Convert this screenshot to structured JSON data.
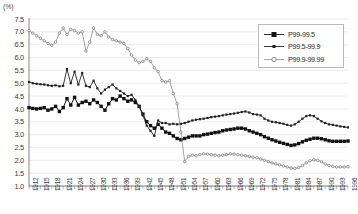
{
  "chart_data": {
    "type": "line",
    "title": "",
    "subtitle": "",
    "unit_label": "(%)",
    "xlabel": "",
    "ylabel": "",
    "ylim": [
      1.0,
      7.5
    ],
    "ytick_step": 0.5,
    "yticks": [
      "7.5",
      "7.0",
      "6.5",
      "6.0",
      "5.5",
      "5.0",
      "4.5",
      "4.0",
      "3.5",
      "3.0",
      "2.5",
      "2.0",
      "1.5",
      "1.0"
    ],
    "xlim": [
      1912,
      1996
    ],
    "xtick_interval_years": 1,
    "xtick_label_interval_years": 3,
    "xticklabels": [
      "1912",
      "1915",
      "1918",
      "1921",
      "1924",
      "1927",
      "1930",
      "1933",
      "1936",
      "1939",
      "1942",
      "1945",
      "1948",
      "1951",
      "1954",
      "1957",
      "1960",
      "1963",
      "1966",
      "1969",
      "1972",
      "1975",
      "1978",
      "1981",
      "1984",
      "1987",
      "1990",
      "1993",
      "1996"
    ],
    "grid": true,
    "grid_axis": "y",
    "legend_position": "top-right",
    "x": [
      1912,
      1913,
      1914,
      1915,
      1916,
      1917,
      1918,
      1919,
      1920,
      1921,
      1922,
      1923,
      1924,
      1925,
      1926,
      1927,
      1928,
      1929,
      1930,
      1931,
      1932,
      1933,
      1934,
      1935,
      1936,
      1937,
      1938,
      1939,
      1940,
      1941,
      1942,
      1943,
      1944,
      1945,
      1946,
      1947,
      1948,
      1949,
      1950,
      1951,
      1952,
      1953,
      1954,
      1955,
      1956,
      1957,
      1958,
      1959,
      1960,
      1961,
      1962,
      1963,
      1964,
      1965,
      1966,
      1967,
      1968,
      1969,
      1970,
      1971,
      1972,
      1973,
      1974,
      1975,
      1976,
      1977,
      1978,
      1979,
      1980,
      1981,
      1982,
      1983,
      1984,
      1985,
      1986,
      1987,
      1988,
      1989,
      1990,
      1991,
      1992,
      1993,
      1994,
      1995,
      1996
    ],
    "series": [
      {
        "name": "P99-99.5",
        "marker": "filled-square",
        "color": "#111111",
        "linewidth": 1.0,
        "values": [
          4.05,
          4.02,
          4.0,
          4.02,
          4.05,
          3.95,
          4.0,
          4.1,
          3.9,
          4.05,
          4.4,
          4.15,
          4.45,
          4.15,
          4.25,
          4.3,
          4.2,
          4.35,
          4.25,
          4.1,
          3.95,
          4.2,
          4.4,
          4.35,
          4.5,
          4.4,
          4.3,
          4.35,
          4.25,
          4.1,
          3.8,
          3.5,
          3.35,
          3.25,
          3.4,
          3.25,
          3.1,
          3.05,
          2.95,
          2.85,
          2.8,
          2.85,
          2.9,
          2.95,
          2.95,
          2.95,
          3.0,
          3.02,
          3.05,
          3.08,
          3.1,
          3.15,
          3.18,
          3.2,
          3.22,
          3.25,
          3.25,
          3.22,
          3.15,
          3.1,
          3.05,
          3.0,
          2.92,
          2.86,
          2.8,
          2.75,
          2.7,
          2.66,
          2.62,
          2.58,
          2.6,
          2.65,
          2.72,
          2.78,
          2.82,
          2.86,
          2.86,
          2.84,
          2.8,
          2.76,
          2.74,
          2.74,
          2.74,
          2.74,
          2.75
        ]
      },
      {
        "name": "P99.5-99.9",
        "marker": "small-dot",
        "color": "#222222",
        "linewidth": 0.9,
        "values": [
          5.05,
          5.0,
          4.98,
          4.96,
          4.95,
          4.92,
          4.9,
          4.92,
          4.88,
          4.9,
          5.55,
          5.0,
          5.45,
          4.95,
          5.4,
          4.9,
          4.85,
          5.1,
          4.8,
          4.6,
          4.75,
          4.85,
          4.95,
          4.8,
          4.7,
          4.6,
          4.5,
          4.55,
          4.35,
          4.1,
          3.75,
          3.35,
          3.15,
          2.95,
          3.55,
          3.45,
          3.45,
          3.4,
          3.42,
          3.4,
          3.42,
          3.45,
          3.5,
          3.55,
          3.58,
          3.6,
          3.62,
          3.65,
          3.68,
          3.7,
          3.72,
          3.75,
          3.78,
          3.8,
          3.82,
          3.85,
          3.88,
          3.9,
          3.86,
          3.8,
          3.78,
          3.75,
          3.62,
          3.55,
          3.5,
          3.48,
          3.45,
          3.42,
          3.38,
          3.35,
          3.4,
          3.5,
          3.62,
          3.72,
          3.75,
          3.72,
          3.62,
          3.52,
          3.45,
          3.4,
          3.38,
          3.35,
          3.32,
          3.3,
          3.28
        ]
      },
      {
        "name": "P99.9-99.99",
        "marker": "open-circle",
        "color": "#8a8a8a",
        "linewidth": 0.8,
        "values": [
          7.05,
          6.95,
          6.85,
          6.75,
          6.65,
          6.55,
          6.48,
          6.6,
          6.95,
          7.15,
          6.9,
          7.1,
          7.05,
          6.95,
          7.0,
          6.25,
          6.6,
          7.15,
          6.9,
          6.85,
          7.0,
          6.8,
          6.7,
          6.65,
          6.6,
          6.55,
          6.35,
          6.1,
          5.9,
          5.8,
          5.85,
          5.95,
          5.85,
          5.6,
          5.45,
          5.1,
          5.05,
          5.1,
          4.6,
          4.2,
          3.1,
          1.95,
          2.15,
          2.2,
          2.18,
          2.22,
          2.25,
          2.24,
          2.22,
          2.2,
          2.18,
          2.2,
          2.22,
          2.25,
          2.24,
          2.22,
          2.2,
          2.18,
          2.15,
          2.12,
          2.1,
          2.05,
          2.0,
          1.95,
          1.9,
          1.86,
          1.82,
          1.78,
          1.74,
          1.7,
          1.68,
          1.72,
          1.8,
          1.9,
          1.98,
          2.02,
          2.0,
          1.94,
          1.86,
          1.8,
          1.76,
          1.74,
          1.74,
          1.74,
          1.75
        ]
      }
    ]
  },
  "legend": {
    "items": [
      {
        "label": "P99-99.5",
        "marker": "filled-square"
      },
      {
        "label": "P99.5-99.9",
        "marker": "small-dot"
      },
      {
        "label": "P99.9-99.99",
        "marker": "open-circle"
      }
    ]
  }
}
